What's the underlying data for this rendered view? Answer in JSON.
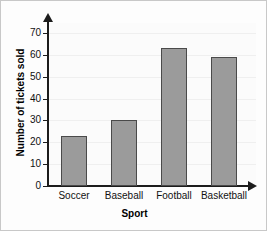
{
  "chart_data": {
    "type": "bar",
    "title": "",
    "xlabel": "Sport",
    "ylabel": "Number of tickets sold",
    "categories": [
      "Soccer",
      "Baseball",
      "Football",
      "Basketball"
    ],
    "values": [
      23,
      30,
      63,
      59
    ],
    "ylim": [
      0,
      70
    ],
    "ytick_step": 10,
    "yticks": [
      0,
      10,
      20,
      30,
      40,
      50,
      60,
      70
    ],
    "ytick_labels": [
      "0",
      "10",
      "20",
      "30",
      "40",
      "50",
      "60",
      "70"
    ],
    "grid": true,
    "grid_axis": "y",
    "legend": null,
    "bar_fill_color": "#9b9b9b",
    "bar_border_color": "#4a4a4a",
    "axis_color": "#1c1c1c",
    "background_color": "#fbfbfb"
  }
}
